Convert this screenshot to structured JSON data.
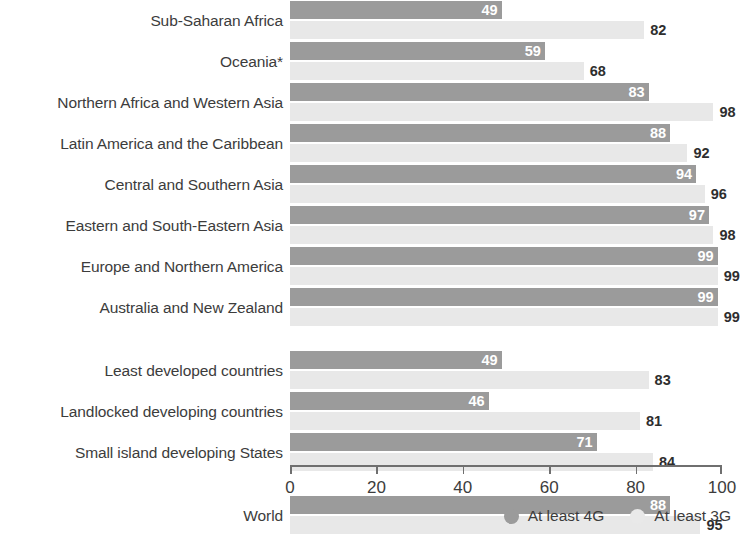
{
  "chart_data": {
    "type": "bar",
    "title": "",
    "subtitle": "",
    "xlabel": "",
    "ylabel": "",
    "orientation": "horizontal",
    "xlim": [
      0,
      100
    ],
    "xticks": [
      0,
      20,
      40,
      60,
      80,
      100
    ],
    "xtick_labels": [
      "0",
      "20",
      "40",
      "60",
      "80",
      "100"
    ],
    "grid": false,
    "legend_position": "bottom-right",
    "categories": [
      "Sub-Saharan Africa",
      "Oceania*",
      "Northern Africa and Western Asia",
      "Latin America and the Caribbean",
      "Central and Southern Asia",
      "Eastern and South-Eastern Asia",
      "Europe and Northern America",
      "Australia and New Zealand",
      "Least developed countries",
      "Landlocked developing countries",
      "Small island developing States",
      "World"
    ],
    "group_breaks_after": [
      7,
      10
    ],
    "series": [
      {
        "name": "At least 4G",
        "color": "#9b9b9b",
        "values": [
          49,
          59,
          83,
          88,
          94,
          97,
          99,
          99,
          49,
          46,
          71,
          88
        ]
      },
      {
        "name": "At least 3G",
        "color": "#e8e8e8",
        "values": [
          82,
          68,
          98,
          92,
          96,
          98,
          99,
          99,
          83,
          81,
          84,
          95
        ]
      }
    ]
  },
  "legend": {
    "items": [
      {
        "label": "At least 4G",
        "swatch": "circle-dark-gray"
      },
      {
        "label": "At least 3G",
        "swatch": "circle-light-gray"
      }
    ]
  },
  "colors": {
    "bar_4g": "#9b9b9b",
    "bar_3g": "#e8e8e8",
    "axis": "#6f6f6f",
    "text": "#3c3c3c",
    "value_inside": "#ffffff",
    "value_outside": "#2e2e2e",
    "background": "#ffffff"
  }
}
